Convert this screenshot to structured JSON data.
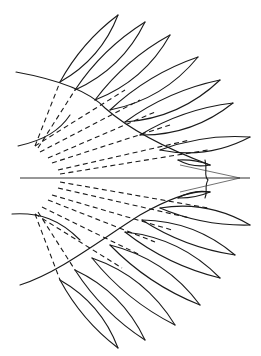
{
  "figure": {
    "type": "line-drawing",
    "stroke_color": "#1a1a1a",
    "background": "#ffffff",
    "petal_count_upper": 9,
    "petal_count_lower": 9
  }
}
